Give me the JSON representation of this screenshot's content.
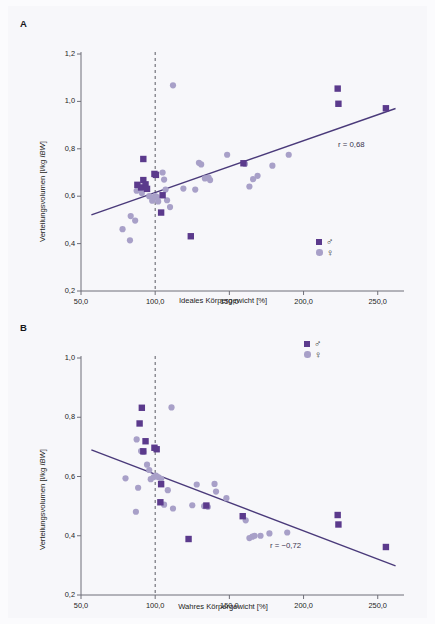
{
  "figure": {
    "background": "#f7f7fa",
    "marker_male_color": "#5b3a8c",
    "marker_female_color": "#a8a0c8",
    "line_color": "#4a3a7a",
    "refline_color": "#5a5a62"
  },
  "panels": [
    {
      "letter": "A",
      "legend": {
        "male_symbol": "♂",
        "female_symbol": "♀"
      },
      "annotation": "r = 0,68",
      "chart_data": {
        "type": "scatter",
        "title": "",
        "xlabel": "Ideales Körpergewicht [%]",
        "ylabel": "Verteilungsvolumen [l/kg IBW]",
        "ylabel_plain": "Verteilungsvolumen [l/kg ",
        "ylabel_italic": "IBW",
        "ylabel_tail": "]",
        "xlim": [
          50,
          265
        ],
        "ylim": [
          0.2,
          1.2
        ],
        "xticks": [
          50,
          100,
          150,
          200,
          250
        ],
        "xtick_labels": [
          "50,0",
          "100,0",
          "150,0",
          "200,0",
          "250,0"
        ],
        "yticks": [
          0.2,
          0.4,
          0.6,
          0.8,
          1.0,
          1.2
        ],
        "ytick_labels": [
          "0,2",
          "0,4",
          "0,6",
          "0,8",
          "1,0",
          "1,2"
        ],
        "grid": false,
        "reference_line_x": 100,
        "trend_line": {
          "x0": 57,
          "y0": 0.521,
          "x1": 262,
          "y1": 0.97
        },
        "correlation_r": 0.68,
        "legend_position": "bottom-right",
        "series": [
          {
            "name": "♂",
            "marker": "square",
            "color": "#5b3a8c",
            "points": [
              [
                92.0,
                0.757
              ],
              [
                88.0,
                0.648
              ],
              [
                90.5,
                0.637
              ],
              [
                92.0,
                0.668
              ],
              [
                93.5,
                0.65
              ],
              [
                94.5,
                0.631
              ],
              [
                99.5,
                0.694
              ],
              [
                100.5,
                0.69
              ],
              [
                105.0,
                0.604
              ],
              [
                104.0,
                0.531
              ],
              [
                124.0,
                0.431
              ],
              [
                159.5,
                0.739
              ],
              [
                223.0,
                1.054
              ],
              [
                223.5,
                0.99
              ],
              [
                255.5,
                0.971
              ]
            ]
          },
          {
            "name": "♀",
            "marker": "circle",
            "color": "#a8a0c8",
            "points": [
              [
                112.0,
                1.068
              ],
              [
                78.0,
                0.461
              ],
              [
                83.0,
                0.414
              ],
              [
                83.5,
                0.516
              ],
              [
                86.5,
                0.497
              ],
              [
                87.5,
                0.623
              ],
              [
                89.0,
                0.631
              ],
              [
                91.0,
                0.613
              ],
              [
                96.0,
                0.6
              ],
              [
                98.0,
                0.581
              ],
              [
                99.0,
                0.593
              ],
              [
                100.0,
                0.6
              ],
              [
                101.0,
                0.597
              ],
              [
                102.0,
                0.578
              ],
              [
                105.0,
                0.7
              ],
              [
                106.0,
                0.67
              ],
              [
                107.0,
                0.628
              ],
              [
                108.0,
                0.583
              ],
              [
                110.0,
                0.554
              ],
              [
                119.0,
                0.632
              ],
              [
                127.0,
                0.628
              ],
              [
                129.5,
                0.741
              ],
              [
                131.0,
                0.734
              ],
              [
                133.5,
                0.675
              ],
              [
                136.0,
                0.679
              ],
              [
                137.0,
                0.668
              ],
              [
                148.5,
                0.775
              ],
              [
                160.5,
                0.736
              ],
              [
                163.5,
                0.641
              ],
              [
                166.0,
                0.672
              ],
              [
                169.0,
                0.686
              ],
              [
                179.0,
                0.729
              ],
              [
                190.0,
                0.775
              ]
            ]
          }
        ]
      }
    },
    {
      "letter": "B",
      "legend": {
        "male_symbol": "♂",
        "female_symbol": "♀"
      },
      "annotation": "r = −0,72",
      "chart_data": {
        "type": "scatter",
        "title": "",
        "xlabel": "Wahres Körpergewicht [%]",
        "ylabel": "Verteilungsvolumen [l/kg IBW]",
        "ylabel_plain": "Verteilungsvolumen [l/kg ",
        "ylabel_italic": "IBW",
        "ylabel_tail": "]",
        "xlim": [
          50,
          265
        ],
        "ylim": [
          0.2,
          1.0
        ],
        "xticks": [
          50,
          100,
          150,
          200,
          250
        ],
        "xtick_labels": [
          "50,0",
          "100,0",
          "150,0",
          "200,0",
          "250,0"
        ],
        "yticks": [
          0.2,
          0.4,
          0.6,
          0.8,
          1.0
        ],
        "ytick_labels": [
          "0,2",
          "0,4",
          "0,6",
          "0,8",
          "1,0"
        ],
        "grid": false,
        "reference_line_x": 100,
        "trend_line": {
          "x0": 57,
          "y0": 0.69,
          "x1": 262,
          "y1": 0.298
        },
        "correlation_r": -0.72,
        "legend_position": "top-right",
        "series": [
          {
            "name": "♂",
            "marker": "square",
            "color": "#5b3a8c",
            "points": [
              [
                91.0,
                0.832
              ],
              [
                89.5,
                0.779
              ],
              [
                93.5,
                0.719
              ],
              [
                92.0,
                0.685
              ],
              [
                99.5,
                0.697
              ],
              [
                101.0,
                0.692
              ],
              [
                104.0,
                0.574
              ],
              [
                103.5,
                0.513
              ],
              [
                122.5,
                0.389
              ],
              [
                134.5,
                0.502
              ],
              [
                159.0,
                0.466
              ],
              [
                223.0,
                0.47
              ],
              [
                223.5,
                0.438
              ],
              [
                255.5,
                0.362
              ]
            ]
          },
          {
            "name": "♀",
            "marker": "circle",
            "color": "#a8a0c8",
            "points": [
              [
                111.0,
                0.833
              ],
              [
                87.5,
                0.725
              ],
              [
                90.5,
                0.686
              ],
              [
                92.0,
                0.683
              ],
              [
                94.5,
                0.64
              ],
              [
                96.0,
                0.622
              ],
              [
                80.0,
                0.594
              ],
              [
                88.5,
                0.562
              ],
              [
                87.0,
                0.481
              ],
              [
                97.0,
                0.591
              ],
              [
                99.0,
                0.598
              ],
              [
                100.5,
                0.603
              ],
              [
                102.0,
                0.598
              ],
              [
                104.0,
                0.592
              ],
              [
                108.5,
                0.554
              ],
              [
                112.0,
                0.492
              ],
              [
                106.0,
                0.505
              ],
              [
                125.0,
                0.503
              ],
              [
                128.0,
                0.573
              ],
              [
                133.0,
                0.5
              ],
              [
                135.5,
                0.497
              ],
              [
                140.0,
                0.575
              ],
              [
                141.0,
                0.549
              ],
              [
                148.0,
                0.527
              ],
              [
                161.0,
                0.452
              ],
              [
                163.5,
                0.392
              ],
              [
                165.5,
                0.397
              ],
              [
                167.0,
                0.4
              ],
              [
                171.0,
                0.4
              ],
              [
                177.0,
                0.408
              ],
              [
                189.0,
                0.411
              ]
            ]
          }
        ]
      }
    }
  ]
}
